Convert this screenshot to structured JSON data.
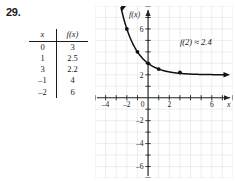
{
  "problem": {
    "number": "29."
  },
  "table": {
    "headers": {
      "x": "x",
      "fx": "f(x)"
    },
    "rows": [
      {
        "x": "0",
        "fx": "3"
      },
      {
        "x": "1",
        "fx": "2.5"
      },
      {
        "x": "3",
        "fx": "2.2"
      },
      {
        "x": "–1",
        "fx": "4"
      },
      {
        "x": "–2",
        "fx": "6"
      }
    ]
  },
  "graph": {
    "y_axis_label": "f(x)",
    "x_axis_label": "x",
    "annotation": "f(2) ≈ 2.4",
    "x_tick_labels": [
      "–4",
      "–2",
      "0",
      "2",
      "6"
    ],
    "y_tick_labels": [
      "6",
      "2",
      "–2",
      "–4",
      "–6"
    ]
  },
  "chart_data": {
    "type": "line",
    "title": "",
    "xlabel": "x",
    "ylabel": "f(x)",
    "xlim": [
      -5,
      8
    ],
    "ylim": [
      -7,
      8
    ],
    "grid": true,
    "legend": null,
    "annotations": [
      {
        "text": "f(2) ≈ 2.4",
        "x": 3.0,
        "y": 4.6
      }
    ],
    "asymptote": 2,
    "series": [
      {
        "name": "f(x)",
        "points": [
          {
            "x": -2,
            "y": 6
          },
          {
            "x": -1,
            "y": 4
          },
          {
            "x": 0,
            "y": 3
          },
          {
            "x": 1,
            "y": 2.5
          },
          {
            "x": 3,
            "y": 2.2
          }
        ]
      }
    ],
    "x_ticks": [
      -4,
      -2,
      0,
      2,
      6
    ],
    "y_ticks": [
      6,
      2,
      -2,
      -4,
      -6
    ]
  }
}
